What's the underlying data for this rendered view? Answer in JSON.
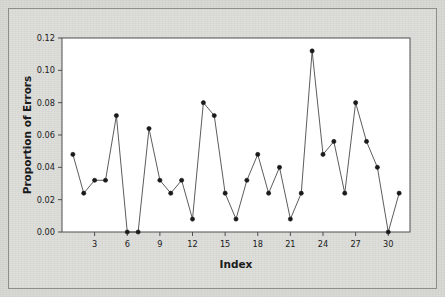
{
  "chart_data": {
    "type": "line",
    "title": "",
    "subtitle": "",
    "xlabel": "Index",
    "ylabel": "Proportion of Errors",
    "xlim": [
      0,
      32
    ],
    "ylim": [
      0.0,
      0.12
    ],
    "grid": false,
    "legend": null,
    "legend_position": "none",
    "marker": "filled-circle",
    "line_style": "solid",
    "x_ticks": [
      3,
      6,
      9,
      12,
      15,
      18,
      21,
      24,
      27,
      30
    ],
    "x_tick_labels": [
      "3",
      "6",
      "9",
      "12",
      "15",
      "18",
      "21",
      "24",
      "27",
      "30"
    ],
    "y_ticks": [
      0.0,
      0.02,
      0.04,
      0.06,
      0.08,
      0.1,
      0.12
    ],
    "y_tick_labels": [
      "0.00",
      "0.02",
      "0.04",
      "0.06",
      "0.08",
      "0.10",
      "0.12"
    ],
    "x": [
      1,
      2,
      3,
      4,
      5,
      6,
      7,
      8,
      9,
      10,
      11,
      12,
      13,
      14,
      15,
      16,
      17,
      18,
      19,
      20,
      21,
      22,
      23,
      24,
      25,
      26,
      27,
      28,
      29,
      30,
      31
    ],
    "values": [
      0.048,
      0.024,
      0.032,
      0.032,
      0.072,
      0.0,
      0.0,
      0.064,
      0.032,
      0.024,
      0.032,
      0.008,
      0.08,
      0.072,
      0.024,
      0.008,
      0.032,
      0.048,
      0.024,
      0.04,
      0.008,
      0.024,
      0.112,
      0.048,
      0.056,
      0.024,
      0.08,
      0.056,
      0.04,
      0.0,
      0.024
    ],
    "series": [
      {
        "name": "Proportion of Errors",
        "values": [
          0.048,
          0.024,
          0.032,
          0.032,
          0.072,
          0.0,
          0.0,
          0.064,
          0.032,
          0.024,
          0.032,
          0.008,
          0.08,
          0.072,
          0.024,
          0.008,
          0.032,
          0.048,
          0.024,
          0.04,
          0.008,
          0.024,
          0.112,
          0.048,
          0.056,
          0.024,
          0.08,
          0.056,
          0.04,
          0.0,
          0.024
        ],
        "color": "#1a1a1a"
      }
    ],
    "colors": {
      "line": "#4a4a4a",
      "marker": "#1a1a1a",
      "plot_background": "#ffffff",
      "frame": "#4f4f4f",
      "figure_background": "#dcdcd9",
      "text": "#1b1b1b"
    }
  }
}
